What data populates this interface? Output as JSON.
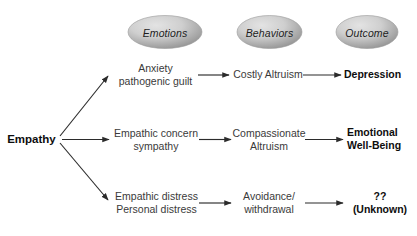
{
  "diagram": {
    "columns": [
      {
        "id": "emotions",
        "label": "Emotions"
      },
      {
        "id": "behaviors",
        "label": "Behaviors"
      },
      {
        "id": "outcome",
        "label": "Outcome"
      }
    ],
    "root": {
      "label": "Empathy"
    },
    "rows": [
      {
        "id": "row-depression",
        "emotion": "Anxiety\npathogenic guilt",
        "emotion_line1": "Anxiety",
        "emotion_line2": "pathogenic guilt",
        "behavior_line1": "Costly Altruism",
        "behavior_line2": "",
        "outcome_line1": "Depression",
        "outcome_line2": ""
      },
      {
        "id": "row-wellbeing",
        "emotion_line1": "Empathic concern",
        "emotion_line2": "sympathy",
        "behavior_line1": "Compassionate",
        "behavior_line2": "Altruism",
        "outcome_line1": "Emotional",
        "outcome_line2": "Well-Being"
      },
      {
        "id": "row-unknown",
        "emotion_line1": "Empathic distress",
        "emotion_line2": "Personal distress",
        "behavior_line1": "Avoidance/",
        "behavior_line2": "withdrawal",
        "outcome_line1": "??",
        "outcome_line2": "(Unknown)"
      }
    ],
    "colors": {
      "pill_fill_light": "#d9d9d9",
      "pill_fill_dark": "#8d8d8d",
      "arrow": "#2b2b2b",
      "text": "#3a3a3a",
      "text_bold": "#0d0d0d",
      "background": "#ffffff"
    }
  }
}
